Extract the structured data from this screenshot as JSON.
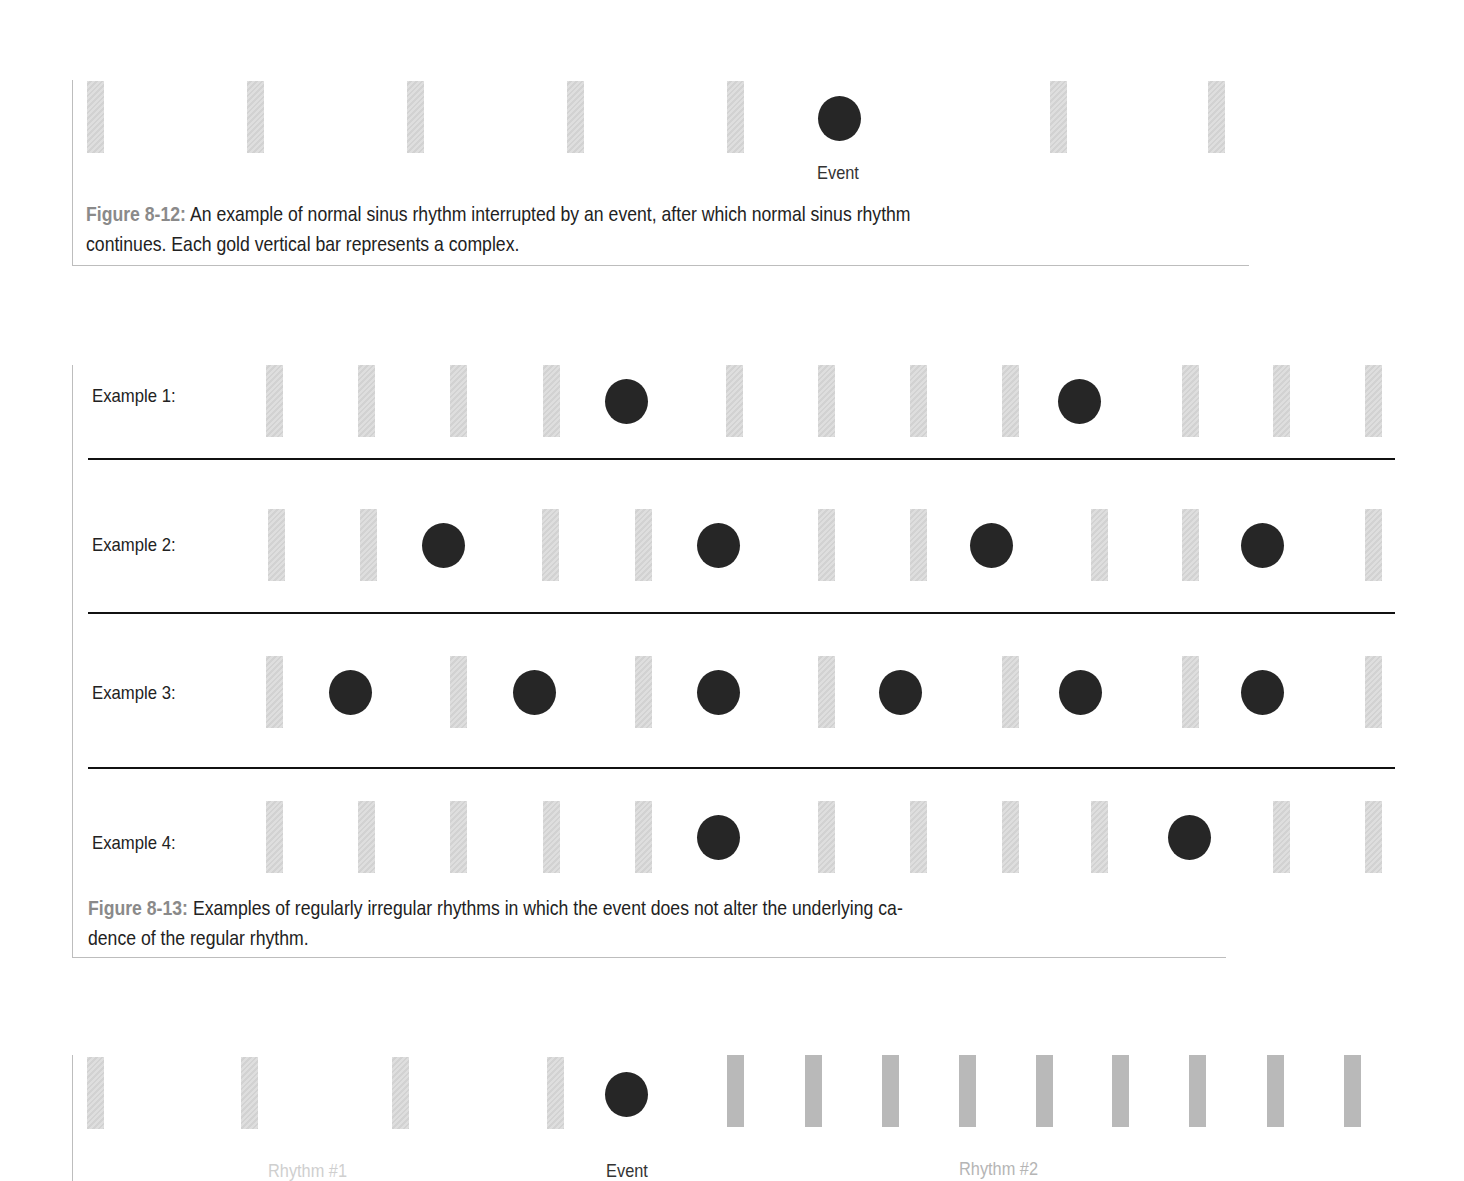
{
  "figure_8_12": {
    "event_label": "Event",
    "caption_number": "Figure 8-12:",
    "caption_line1": " An example of normal sinus rhythm interrupted by an event, after which normal sinus rhythm",
    "caption_line2": "continues. Each gold vertical bar represents a complex.",
    "bar_x": [
      87,
      247,
      407,
      567,
      727,
      1050,
      1208
    ],
    "event_x": 818
  },
  "figure_8_13": {
    "rows": [
      {
        "label": "Example 1:",
        "bars": [
          266,
          358,
          450,
          543,
          726,
          818,
          910,
          1002,
          1182,
          1273,
          1365
        ],
        "events": [
          605,
          1058
        ]
      },
      {
        "label": "Example 2:",
        "bars": [
          268,
          360,
          542,
          635,
          818,
          910,
          1091,
          1182,
          1365
        ],
        "events": [
          422,
          697,
          970,
          1241
        ]
      },
      {
        "label": "Example 3:",
        "bars": [
          266,
          450,
          635,
          818,
          1002,
          1182,
          1365
        ],
        "events": [
          329,
          513,
          697,
          879,
          1059,
          1241
        ]
      },
      {
        "label": "Example 4:",
        "bars": [
          266,
          358,
          450,
          543,
          635,
          818,
          910,
          1002,
          1091,
          1273,
          1365
        ],
        "events": [
          697,
          1168
        ]
      }
    ],
    "caption_number": "Figure 8-13:",
    "caption_line1": " Examples of regularly irregular rhythms in which the event does not alter the underlying ca-",
    "caption_line2": "dence of the regular rhythm."
  },
  "figure_bottom": {
    "rhythm1_label": "Rhythm #1",
    "event_label": "Event",
    "rhythm2_label": "Rhythm #2",
    "rhythm1_bars": [
      87,
      241,
      392,
      547
    ],
    "event_x": 605,
    "rhythm2_bars": [
      727,
      805,
      882,
      959,
      1036,
      1112,
      1189,
      1267,
      1344
    ]
  },
  "colors": {
    "bar_light": "#d9d9d9",
    "bar_dark": "#b9b9b9",
    "event_dot": "#262626",
    "caption_number": "#8a8a8a",
    "separator": "#111111"
  }
}
